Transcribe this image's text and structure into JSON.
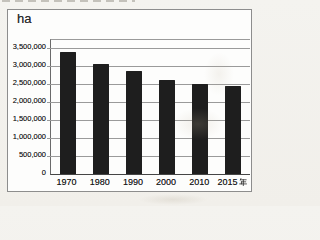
{
  "chart": {
    "unit_label": "ha"
  },
  "chart_data": {
    "type": "bar",
    "title": "",
    "categories": [
      "1970",
      "1980",
      "1990",
      "2000",
      "2010",
      "2015"
    ],
    "x_suffix_unit": "年",
    "values": [
      3400000,
      3050000,
      2850000,
      2600000,
      2500000,
      2450000
    ],
    "ylabel": "ha",
    "ylim": [
      0,
      3500000
    ],
    "ytick_interval": 500000,
    "ytick_labels": [
      "0",
      "500,000",
      "1,000,000",
      "1,500,000",
      "2,000,000",
      "2,500,000",
      "3,000,000",
      "3,500,000"
    ],
    "grid": true,
    "legend": false,
    "bar_color": "#1e1e1e",
    "gridline_color": "#9a9a9a"
  }
}
